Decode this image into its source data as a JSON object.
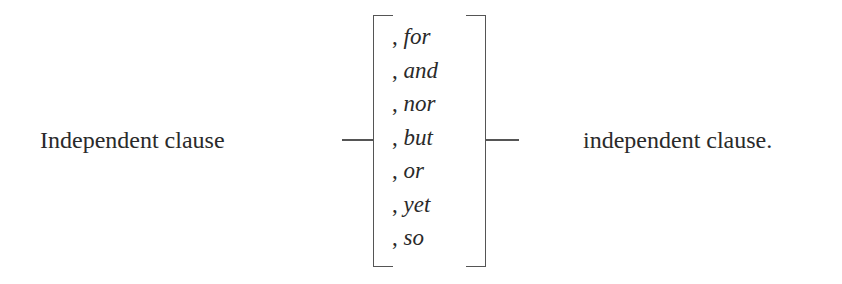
{
  "diagram": {
    "left_clause": "Independent clause",
    "right_clause": "independent clause.",
    "conjunctions": [
      {
        "comma": ",",
        "word": "for"
      },
      {
        "comma": ",",
        "word": "and"
      },
      {
        "comma": ",",
        "word": "nor"
      },
      {
        "comma": ",",
        "word": "but"
      },
      {
        "comma": ",",
        "word": "or"
      },
      {
        "comma": ",",
        "word": "yet"
      },
      {
        "comma": ",",
        "word": "so"
      }
    ],
    "colors": {
      "text": "#2a2a2a",
      "lines": "#555555",
      "background": "#ffffff"
    }
  }
}
